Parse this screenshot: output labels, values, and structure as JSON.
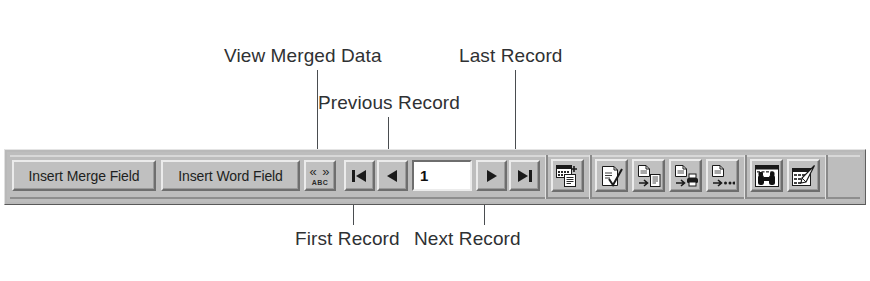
{
  "figure": {
    "background_color": "#ffffff",
    "line_color": "#4a4d50"
  },
  "callouts": [
    {
      "id": "view-merged-data",
      "label": "View Merged Data"
    },
    {
      "id": "last-record",
      "label": "Last Record"
    },
    {
      "id": "previous-record",
      "label": "Previous Record"
    },
    {
      "id": "first-record",
      "label": "First Record"
    },
    {
      "id": "next-record",
      "label": "Next Record"
    }
  ],
  "toolbar": {
    "face_color": "#bdbdbd",
    "buttons": {
      "insert_merge_field": "Insert Merge Field",
      "insert_word_field": "Insert Word Field",
      "view_merged_data_top": "« »",
      "view_merged_data_bottom": "ABC",
      "first_record": "first-record-icon",
      "previous_record": "previous-record-icon",
      "record_number_value": "1",
      "record_number_placeholder": "1",
      "next_record": "next-record-icon",
      "last_record": "last-record-icon",
      "mail_merge_helper": "mail-merge-helper-icon",
      "check_for_errors": "check-for-errors-icon",
      "merge_to_new_document": "merge-to-new-document-icon",
      "merge_to_printer": "merge-to-printer-icon",
      "merge": "merge-icon",
      "find_record": "find-record-binoculars-icon",
      "edit_data_source": "edit-data-source-icon"
    }
  }
}
